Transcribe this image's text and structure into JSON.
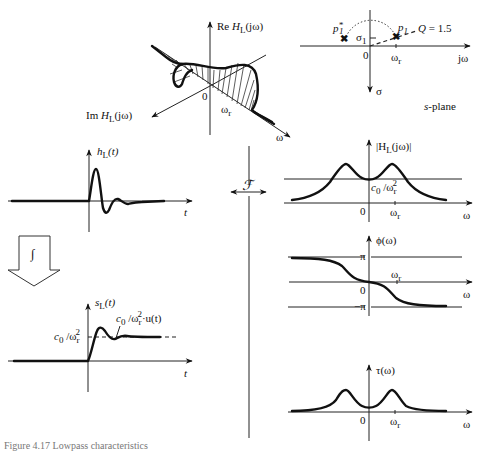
{
  "figure": {
    "caption": "Figure 4.17   Lowpass characteristics",
    "transform_symbol": "ℱ",
    "integral_symbol": "∫"
  },
  "nyquist_3d": {
    "re_label": "Re Hₗ(jω)",
    "re_prefix": "Re ",
    "re_func": "H",
    "re_sub": "L",
    "re_arg": "(jω)",
    "im_prefix": "Im ",
    "im_func": "H",
    "im_sub": "L",
    "im_arg": "(jω)",
    "origin": "0",
    "omega_r": "ω",
    "omega_r_sub": "r",
    "omega_axis": "ω"
  },
  "s_plane": {
    "title": "s-plane",
    "pole_conj": "p",
    "pole_conj_sup": "*",
    "pole_conj_sub": "1",
    "pole": "p",
    "pole_sub": "1",
    "sigma1": "σ",
    "sigma1_sub": "1",
    "q_label": "Q = 1.5",
    "origin": "0",
    "omega_r": "ω",
    "omega_r_sub": "r",
    "jw_axis": "jω",
    "sigma_axis": "σ"
  },
  "impulse_response": {
    "ylabel_func": "h",
    "ylabel_sub": "L",
    "ylabel_arg": "(t)",
    "xlabel": "t"
  },
  "step_response": {
    "ylabel_func": "s",
    "ylabel_sub": "L",
    "ylabel_arg": "(t)",
    "xlabel": "t",
    "level_label": "c₀ /ωᵣ²",
    "level_c": "c",
    "level_c_sub": "0",
    "level_w": " /ω",
    "level_w_sub": "r",
    "level_w_sup": "2",
    "asym_label_tail": "·u(t)"
  },
  "magnitude": {
    "ylabel_pre": "|H",
    "ylabel_sub": "L",
    "ylabel_post": "(jω)|",
    "level_c": "c",
    "level_c_sub": "0",
    "level_w": " /ω",
    "level_w_sub": "r",
    "level_w_sup": "2",
    "origin": "0",
    "omega_r": "ω",
    "omega_r_sub": "r",
    "xlabel": "ω"
  },
  "phase": {
    "ylabel": "ϕ(ω)",
    "pi": "π",
    "neg_pi": "−π",
    "origin": "0",
    "omega_r": "ω",
    "omega_r_sub": "r",
    "xlabel": "ω"
  },
  "group_delay": {
    "ylabel": "τ(ω)",
    "origin": "0",
    "omega_r": "ω",
    "omega_r_sub": "r",
    "xlabel": "ω"
  }
}
